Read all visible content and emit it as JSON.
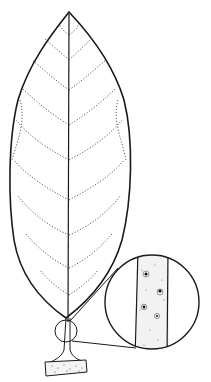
{
  "figure": {
    "colors": {
      "background": "#ffffff",
      "ink": "#1a1a1a"
    },
    "parts": [
      "leaf-blade",
      "midrib",
      "lateral-veins",
      "petiole",
      "twig",
      "magnifier-circle-small",
      "magnifier-circle-large",
      "lenticels"
    ]
  }
}
